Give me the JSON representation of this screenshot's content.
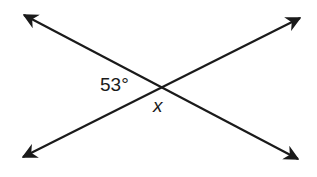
{
  "diagram": {
    "type": "intersecting-lines",
    "labels": {
      "angle": "53°",
      "variable": "x"
    },
    "colors": {
      "line": "#1a1a1a",
      "background": "#ffffff"
    },
    "lines": [
      {
        "from": [
          24,
          15
        ],
        "to": [
          298,
          159
        ],
        "arrows": "both"
      },
      {
        "from": [
          23,
          157
        ],
        "to": [
          300,
          18
        ],
        "arrows": "both"
      }
    ]
  }
}
